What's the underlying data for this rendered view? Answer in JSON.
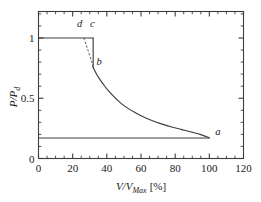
{
  "figure": {
    "name": "pressure-volume-characteristic",
    "caption_fragment": ""
  },
  "chart_data": {
    "type": "line",
    "title": "",
    "xlabel": "V/VMax [%]",
    "xlabel_parts": {
      "num": "V",
      "den": "V",
      "den_sub": "Max",
      "unit": "[%]"
    },
    "ylabel": "P/Pd",
    "ylabel_parts": {
      "num": "P",
      "den": "P",
      "den_sub": "d"
    },
    "xlim": [
      0,
      120
    ],
    "ylim": [
      0,
      1.22
    ],
    "xticks": [
      0,
      20,
      40,
      60,
      80,
      100,
      120
    ],
    "xticklabels": [
      "0",
      "20",
      "40",
      "60",
      "80",
      "100",
      "120"
    ],
    "yticks": [
      0,
      0.5,
      1
    ],
    "yticklabels": [
      "0",
      "0.5",
      "1"
    ],
    "x_minor_step": 5,
    "y_minor_step": 0.1,
    "grid": false,
    "legend": null,
    "annotations": [
      {
        "label": "a",
        "x": 100,
        "y": 0.17,
        "text_x": 105,
        "text_y": 0.195
      },
      {
        "label": "b",
        "x": 32,
        "y": 0.755,
        "text_x": 35.5,
        "text_y": 0.78
      },
      {
        "label": "c",
        "x": 32,
        "y": 1.0,
        "text_x": 31.5,
        "text_y": 1.095
      },
      {
        "label": "d",
        "x": 26.5,
        "y": 1.0,
        "text_x": 24.0,
        "text_y": 1.095
      }
    ],
    "series": [
      {
        "name": "rated-power-plateau",
        "style": "solid",
        "points": [
          {
            "x": 0,
            "y": 1.0
          },
          {
            "x": 26.5,
            "y": 1.0
          },
          {
            "x": 32.0,
            "y": 1.0
          }
        ]
      },
      {
        "name": "constant-power-drop-c-b",
        "style": "solid",
        "points": [
          {
            "x": 32.0,
            "y": 1.0
          },
          {
            "x": 32.0,
            "y": 0.755
          }
        ]
      },
      {
        "name": "hyperbolic-decay-b-a",
        "style": "solid",
        "points": [
          {
            "x": 32,
            "y": 0.755
          },
          {
            "x": 34,
            "y": 0.7
          },
          {
            "x": 36,
            "y": 0.655
          },
          {
            "x": 38,
            "y": 0.615
          },
          {
            "x": 40,
            "y": 0.578
          },
          {
            "x": 44,
            "y": 0.515
          },
          {
            "x": 48,
            "y": 0.462
          },
          {
            "x": 52,
            "y": 0.42
          },
          {
            "x": 56,
            "y": 0.385
          },
          {
            "x": 60,
            "y": 0.355
          },
          {
            "x": 66,
            "y": 0.317
          },
          {
            "x": 72,
            "y": 0.287
          },
          {
            "x": 78,
            "y": 0.262
          },
          {
            "x": 84,
            "y": 0.24
          },
          {
            "x": 90,
            "y": 0.218
          },
          {
            "x": 95,
            "y": 0.198
          },
          {
            "x": 100,
            "y": 0.172
          }
        ]
      },
      {
        "name": "minimum-power-baseline",
        "style": "solid",
        "points": [
          {
            "x": 0,
            "y": 0.17
          },
          {
            "x": 100,
            "y": 0.17
          }
        ]
      },
      {
        "name": "transition-d-b",
        "style": "dashed",
        "points": [
          {
            "x": 26.5,
            "y": 1.0
          },
          {
            "x": 28.0,
            "y": 0.94
          },
          {
            "x": 29.5,
            "y": 0.875
          },
          {
            "x": 31.0,
            "y": 0.81
          },
          {
            "x": 32.0,
            "y": 0.755
          }
        ]
      }
    ]
  }
}
